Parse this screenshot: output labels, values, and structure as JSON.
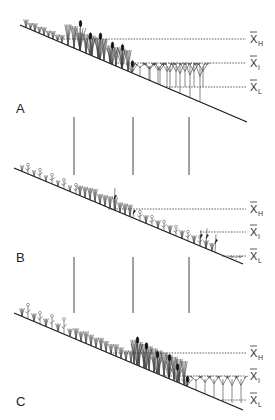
{
  "figure": {
    "panels": [
      {
        "letter": "A",
        "levels": [
          {
            "symbol": "X",
            "subscript": "H",
            "meaning": "high"
          },
          {
            "symbol": "X",
            "subscript": "I",
            "meaning": "intermediate"
          },
          {
            "symbol": "X",
            "subscript": "L",
            "meaning": "low"
          }
        ],
        "vegetation": [
          "sedges-grasses",
          "cattails",
          "submerged-branching"
        ]
      },
      {
        "letter": "B",
        "levels": [
          {
            "symbol": "X",
            "subscript": "H",
            "meaning": "high"
          },
          {
            "symbol": "X",
            "subscript": "I",
            "meaning": "intermediate"
          },
          {
            "symbol": "X",
            "subscript": "L",
            "meaning": "low"
          }
        ],
        "vegetation": [
          "wet-meadow-forbs",
          "mixed-emergents",
          "few-submerged"
        ]
      },
      {
        "letter": "C",
        "levels": [
          {
            "symbol": "X",
            "subscript": "H",
            "meaning": "high"
          },
          {
            "symbol": "X",
            "subscript": "I",
            "meaning": "intermediate"
          },
          {
            "symbol": "X",
            "subscript": "L",
            "meaning": "low"
          }
        ],
        "vegetation": [
          "wet-meadow-forbs",
          "cattails",
          "submerged-branching"
        ]
      }
    ],
    "transition_arrows": [
      "A-to-B",
      "B-to-C"
    ]
  }
}
